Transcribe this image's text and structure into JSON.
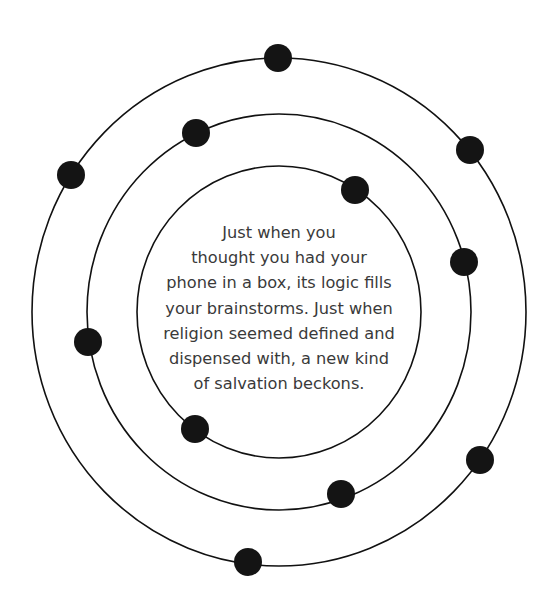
{
  "diagram": {
    "center": {
      "x": 279,
      "y": 312
    },
    "orbits": [
      {
        "name": "inner",
        "rx": 142,
        "ry": 146
      },
      {
        "name": "middle",
        "rx": 192,
        "ry": 198
      },
      {
        "name": "outer",
        "rx": 247,
        "ry": 254
      }
    ],
    "planet_radius": 14,
    "planets": [
      {
        "orbit": "outer",
        "x": 278,
        "y": 58
      },
      {
        "orbit": "outer",
        "x": 71,
        "y": 175
      },
      {
        "orbit": "outer",
        "x": 470,
        "y": 150
      },
      {
        "orbit": "outer",
        "x": 480,
        "y": 460
      },
      {
        "orbit": "outer",
        "x": 248,
        "y": 562
      },
      {
        "orbit": "middle",
        "x": 196,
        "y": 133
      },
      {
        "orbit": "middle",
        "x": 88,
        "y": 342
      },
      {
        "orbit": "middle",
        "x": 464,
        "y": 262
      },
      {
        "orbit": "middle",
        "x": 341,
        "y": 494
      },
      {
        "orbit": "inner",
        "x": 355,
        "y": 190
      },
      {
        "orbit": "inner",
        "x": 195,
        "y": 429
      }
    ],
    "colors": {
      "line": "#111111",
      "planet": "#141414",
      "text": "#3a3a3a",
      "background": "#ffffff"
    }
  },
  "caption": {
    "lines": [
      "Just when you",
      "thought you had your",
      "phone in a box, its logic fills",
      "your brainstorms. Just when",
      "religion seemed defined and",
      "dispensed with, a new kind",
      "of salvation beckons."
    ]
  }
}
